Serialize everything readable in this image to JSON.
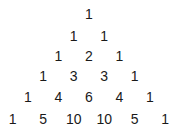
{
  "rows": [
    [
      1
    ],
    [
      1,
      1
    ],
    [
      1,
      2,
      1
    ],
    [
      1,
      3,
      3,
      1
    ],
    [
      1,
      4,
      6,
      4,
      1
    ],
    [
      1,
      5,
      10,
      10,
      5,
      1
    ]
  ],
  "layout": {
    "center_x": 89,
    "col_step": 30.5,
    "row_y": [
      14,
      36,
      56,
      76,
      97,
      119
    ]
  }
}
